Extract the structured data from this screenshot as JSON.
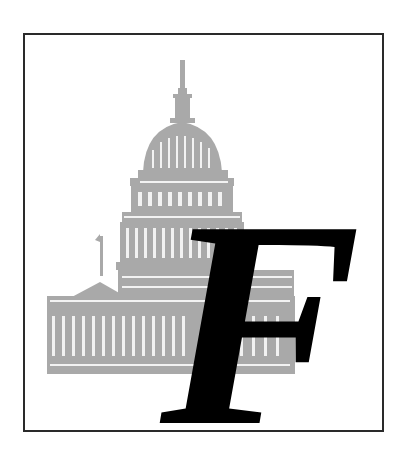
{
  "illustration": {
    "subject": "United States Capitol building",
    "style": "gray engraving",
    "colors": {
      "frame": "#2a2a2a",
      "building": "#a9a9a9",
      "building_highlight": "#ffffff",
      "letter": "#000000",
      "background": "#ffffff"
    }
  },
  "dropcap": {
    "letter": "F"
  }
}
